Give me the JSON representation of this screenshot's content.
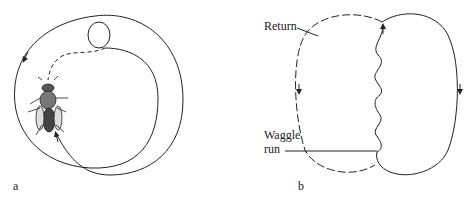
{
  "panels": [
    {
      "id": "a",
      "label": "a",
      "description": "Round path with bee in center"
    },
    {
      "id": "b",
      "label": "b",
      "description": "Figure-eight waggle dance"
    }
  ],
  "annotations": {
    "return_label": "Return",
    "waggle_label_line1": "Waggle",
    "waggle_label_line2": "run"
  },
  "colors": {
    "line": "#222222",
    "background": "#ffffff"
  }
}
